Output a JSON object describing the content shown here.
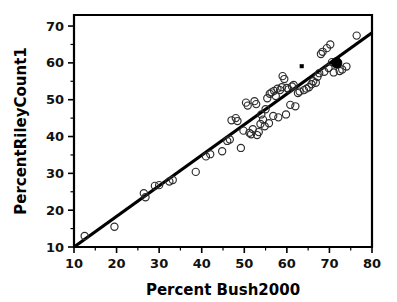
{
  "chart_data": {
    "type": "scatter",
    "title": "",
    "xlabel": "Percent Bush2000",
    "ylabel": "PercentRileyCount1",
    "xlim": [
      10,
      80
    ],
    "ylim": [
      10,
      73
    ],
    "xticks": [
      10,
      20,
      30,
      40,
      50,
      60,
      70,
      80
    ],
    "yticks": [
      10,
      20,
      30,
      40,
      50,
      60,
      70
    ],
    "xtick_labels": [
      "10",
      "20",
      "30",
      "40",
      "50",
      "60",
      "70",
      "80"
    ],
    "ytick_labels": [
      "10",
      "20",
      "30",
      "40",
      "50",
      "60",
      "70"
    ],
    "minor_tick_step": 5,
    "grid": false,
    "legend": null,
    "series": [
      {
        "name": "counties",
        "marker": "open-circle",
        "marker_color": "#2b2b2b",
        "points": [
          [
            12.5,
            13.0
          ],
          [
            19.5,
            15.5
          ],
          [
            26.4,
            24.6
          ],
          [
            26.8,
            23.5
          ],
          [
            29.0,
            26.6
          ],
          [
            30.0,
            26.8
          ],
          [
            32.4,
            27.8
          ],
          [
            33.2,
            28.2
          ],
          [
            38.6,
            30.4
          ],
          [
            41.0,
            34.6
          ],
          [
            42.0,
            35.2
          ],
          [
            44.8,
            36.0
          ],
          [
            46.0,
            38.8
          ],
          [
            46.6,
            39.2
          ],
          [
            47.0,
            44.4
          ],
          [
            48.0,
            45.0
          ],
          [
            48.4,
            44.2
          ],
          [
            49.2,
            36.9
          ],
          [
            49.8,
            41.6
          ],
          [
            50.4,
            49.2
          ],
          [
            50.8,
            48.4
          ],
          [
            51.2,
            41.0
          ],
          [
            51.6,
            40.6
          ],
          [
            52.0,
            42.0
          ],
          [
            52.4,
            49.6
          ],
          [
            52.8,
            48.8
          ],
          [
            53.0,
            40.4
          ],
          [
            53.4,
            41.2
          ],
          [
            53.8,
            43.4
          ],
          [
            54.0,
            46.0
          ],
          [
            54.4,
            44.6
          ],
          [
            54.8,
            42.8
          ],
          [
            55.0,
            47.4
          ],
          [
            55.4,
            50.4
          ],
          [
            55.8,
            43.6
          ],
          [
            56.0,
            51.6
          ],
          [
            56.4,
            52.0
          ],
          [
            56.8,
            45.6
          ],
          [
            57.0,
            52.4
          ],
          [
            57.4,
            51.0
          ],
          [
            57.8,
            53.0
          ],
          [
            58.0,
            45.2
          ],
          [
            58.4,
            52.6
          ],
          [
            58.8,
            53.4
          ],
          [
            59.0,
            56.4
          ],
          [
            59.4,
            55.6
          ],
          [
            59.8,
            46.0
          ],
          [
            60.0,
            53.2
          ],
          [
            60.4,
            52.8
          ],
          [
            60.8,
            48.6
          ],
          [
            61.2,
            53.6
          ],
          [
            61.6,
            54.0
          ],
          [
            62.0,
            48.2
          ],
          [
            62.6,
            51.8
          ],
          [
            63.0,
            52.2
          ],
          [
            64.0,
            52.6
          ],
          [
            64.6,
            53.0
          ],
          [
            65.2,
            53.4
          ],
          [
            65.8,
            54.2
          ],
          [
            66.2,
            55.0
          ],
          [
            66.8,
            54.6
          ],
          [
            67.2,
            56.2
          ],
          [
            67.6,
            57.2
          ],
          [
            68.0,
            62.4
          ],
          [
            68.4,
            63.0
          ],
          [
            68.8,
            57.6
          ],
          [
            69.4,
            64.0
          ],
          [
            69.8,
            58.6
          ],
          [
            70.2,
            65.0
          ],
          [
            70.6,
            60.2
          ],
          [
            71.0,
            57.4
          ],
          [
            72.4,
            57.8
          ],
          [
            73.0,
            58.2
          ],
          [
            74.0,
            59.0
          ],
          [
            76.4,
            67.4
          ]
        ]
      },
      {
        "name": "highlighted-county",
        "marker": "filled-circle-large",
        "marker_color": "#000000",
        "points": [
          [
            71.7,
            60.0
          ]
        ]
      },
      {
        "name": "small-point",
        "marker": "filled-dot-small",
        "marker_color": "#000000",
        "points": [
          [
            63.5,
            59.1
          ]
        ]
      }
    ],
    "fit_line": {
      "name": "reference-line",
      "color": "#000000",
      "x0": 10.0,
      "y0": 10.0,
      "x1": 80.0,
      "y1": 68.2
    }
  }
}
